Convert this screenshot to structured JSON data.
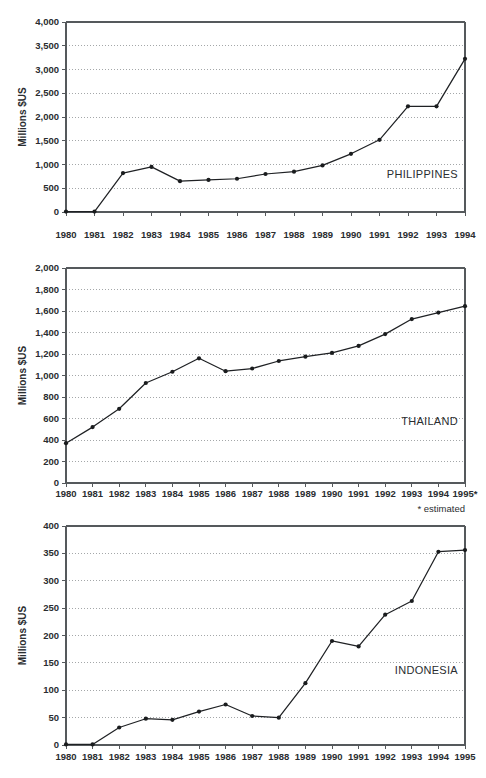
{
  "page": {
    "background": "#ffffff",
    "ink": "#1f2124",
    "grid_color": "#8d9194"
  },
  "chart_data": [
    {
      "id": "philippines",
      "type": "line",
      "title": "",
      "series_label": "PHILIPPINES",
      "xlabel": "",
      "ylabel": "Millions $US",
      "grid": true,
      "legend_position": "inside-right",
      "xlim": [
        1980,
        1994
      ],
      "ylim": [
        0,
        4000
      ],
      "ytick_step": 500,
      "ytick_labels": [
        "0",
        "500",
        "1,000",
        "1,500",
        "2,000",
        "2,500",
        "3,000",
        "3,500",
        "4,000"
      ],
      "ytick_values": [
        0,
        500,
        1000,
        1500,
        2000,
        2500,
        3000,
        3500,
        4000
      ],
      "categories": [
        "1980",
        "1981",
        "1982",
        "1983",
        "1984",
        "1985",
        "1986",
        "1987",
        "1988",
        "1989",
        "1990",
        "1991",
        "1992",
        "1993",
        "1994"
      ],
      "x": [
        1980,
        1981,
        1982,
        1983,
        1984,
        1985,
        1986,
        1987,
        1988,
        1989,
        1990,
        1991,
        1992,
        1993,
        1994
      ],
      "values": [
        10,
        10,
        820,
        950,
        650,
        675,
        700,
        800,
        850,
        980,
        1225,
        1520,
        2225,
        2225,
        3225
      ],
      "annotations": []
    },
    {
      "id": "thailand",
      "type": "line",
      "title": "",
      "series_label": "THAILAND",
      "xlabel": "",
      "ylabel": "Millions $US",
      "grid": true,
      "legend_position": "inside-right",
      "xlim": [
        1980,
        1995
      ],
      "ylim": [
        0,
        2000
      ],
      "ytick_step": 200,
      "ytick_labels": [
        "0",
        "200",
        "400",
        "600",
        "800",
        "1,000",
        "1,200",
        "1,400",
        "1,600",
        "1,800",
        "2,000"
      ],
      "ytick_values": [
        0,
        200,
        400,
        600,
        800,
        1000,
        1200,
        1400,
        1600,
        1800,
        2000
      ],
      "categories": [
        "1980",
        "1981",
        "1982",
        "1983",
        "1984",
        "1985",
        "1986",
        "1987",
        "1988",
        "1989",
        "1990",
        "1991",
        "1992",
        "1993",
        "1994",
        "1995*"
      ],
      "x": [
        1980,
        1981,
        1982,
        1983,
        1984,
        1985,
        1986,
        1987,
        1988,
        1989,
        1990,
        1991,
        1992,
        1993,
        1994,
        1995
      ],
      "values": [
        370,
        520,
        690,
        930,
        1035,
        1160,
        1040,
        1065,
        1135,
        1175,
        1210,
        1275,
        1385,
        1525,
        1585,
        1645
      ],
      "annotations": [
        "* estimated"
      ]
    },
    {
      "id": "indonesia",
      "type": "line",
      "title": "",
      "series_label": "INDONESIA",
      "xlabel": "",
      "ylabel": "Millions $US",
      "grid": true,
      "legend_position": "inside-right",
      "xlim": [
        1980,
        1995
      ],
      "ylim": [
        0,
        400
      ],
      "ytick_step": 50,
      "ytick_labels": [
        "0",
        "50",
        "100",
        "150",
        "200",
        "250",
        "300",
        "350",
        "400"
      ],
      "ytick_values": [
        0,
        50,
        100,
        150,
        200,
        250,
        300,
        350,
        400
      ],
      "categories": [
        "1980",
        "1981",
        "1982",
        "1983",
        "1984",
        "1985",
        "1986",
        "1987",
        "1988",
        "1989",
        "1990",
        "1991",
        "1992",
        "1993",
        "1994",
        "1995"
      ],
      "x": [
        1980,
        1981,
        1982,
        1983,
        1984,
        1985,
        1986,
        1987,
        1988,
        1989,
        1990,
        1991,
        1992,
        1993,
        1994,
        1995
      ],
      "values": [
        1,
        1,
        32,
        48,
        46,
        61,
        74,
        53,
        50,
        113,
        190,
        180,
        238,
        263,
        353,
        356
      ],
      "annotations": []
    }
  ]
}
